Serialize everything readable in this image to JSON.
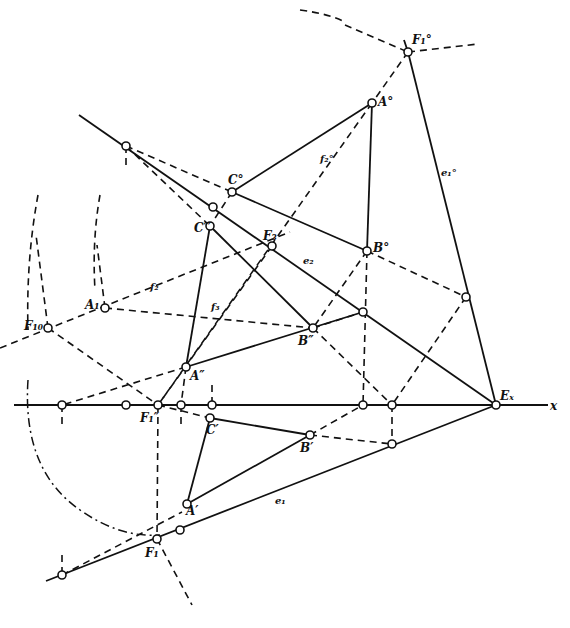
{
  "diagram": {
    "type": "descriptive-geometry-construction",
    "axis_label": "x",
    "labels": {
      "F1_0_top": "F₁°",
      "A_0": "A°",
      "C_0": "C°",
      "C_3": "C‴",
      "F3": "F₃",
      "B_0": "B°",
      "e2": "e₂",
      "e1_0": "e₁°",
      "f2_0": "f₂°",
      "f2": "f₂",
      "f3": "f₃",
      "A1": "A₁",
      "F1_0": "F₁₀",
      "B_2": "B″",
      "A_2": "A″",
      "F1_2": "F₁″",
      "C_1": "C′",
      "B_1": "B′",
      "A_1": "A′",
      "e1": "e₁",
      "F1": "F₁",
      "Ex": "Eₓ",
      "x": "x"
    },
    "points": [
      {
        "id": "F1_0_top",
        "x": 408,
        "y": 52
      },
      {
        "id": "A_0",
        "x": 372,
        "y": 103
      },
      {
        "id": "top_left",
        "x": 126,
        "y": 146
      },
      {
        "id": "C_0",
        "x": 232,
        "y": 192
      },
      {
        "id": "e2_C",
        "x": 213,
        "y": 207
      },
      {
        "id": "C_3",
        "x": 210,
        "y": 226
      },
      {
        "id": "F3",
        "x": 272,
        "y": 246
      },
      {
        "id": "B_0",
        "x": 367,
        "y": 251
      },
      {
        "id": "e1_0_mid",
        "x": 466,
        "y": 297
      },
      {
        "id": "A1",
        "x": 105,
        "y": 308
      },
      {
        "id": "e2_B",
        "x": 363,
        "y": 312
      },
      {
        "id": "F1_0",
        "x": 48,
        "y": 328
      },
      {
        "id": "B_2",
        "x": 313,
        "y": 328
      },
      {
        "id": "A_2",
        "x": 186,
        "y": 367
      },
      {
        "id": "x1",
        "x": 62,
        "y": 405
      },
      {
        "id": "x2",
        "x": 126,
        "y": 405
      },
      {
        "id": "F1_2",
        "x": 158,
        "y": 405
      },
      {
        "id": "x3",
        "x": 181,
        "y": 405
      },
      {
        "id": "x4",
        "x": 212,
        "y": 405
      },
      {
        "id": "x5",
        "x": 363,
        "y": 405
      },
      {
        "id": "x6",
        "x": 392,
        "y": 405
      },
      {
        "id": "Ex",
        "x": 496,
        "y": 405
      },
      {
        "id": "C_1",
        "x": 210,
        "y": 418
      },
      {
        "id": "B_1",
        "x": 310,
        "y": 435
      },
      {
        "id": "e1_pt",
        "x": 392,
        "y": 444
      },
      {
        "id": "A_1",
        "x": 187,
        "y": 504
      },
      {
        "id": "e1_A",
        "x": 180,
        "y": 530
      },
      {
        "id": "F1",
        "x": 157,
        "y": 539
      },
      {
        "id": "e1_end",
        "x": 62,
        "y": 575
      }
    ]
  }
}
